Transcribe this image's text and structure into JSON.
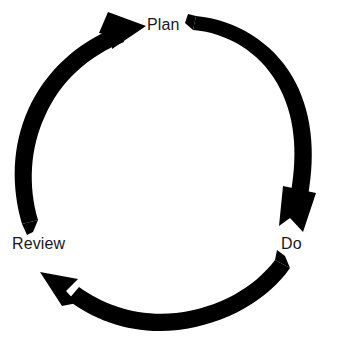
{
  "diagram": {
    "type": "cycle",
    "title": "",
    "shape": "circular-three-stage-cycle",
    "direction": "clockwise",
    "background_color": "#ffffff",
    "arrow_color": "#000000",
    "label_color": "#1a1a1a",
    "stages": [
      {
        "id": "plan",
        "label": "Plan",
        "position": "top"
      },
      {
        "id": "do",
        "label": "Do",
        "position": "right"
      },
      {
        "id": "review",
        "label": "Review",
        "position": "left"
      }
    ],
    "arrows": [
      {
        "id": "plan-to-do",
        "name": "arrow-plan-to-do",
        "from": "Plan",
        "to": "Do",
        "side": "right",
        "tail": "notched",
        "head": "solid-triangle"
      },
      {
        "id": "do-to-review",
        "name": "arrow-do-to-review",
        "from": "Do",
        "to": "Review",
        "side": "bottom",
        "tail": "notched",
        "head": "solid-triangle"
      },
      {
        "id": "review-to-plan",
        "name": "arrow-review-to-plan",
        "from": "Review",
        "to": "Plan",
        "side": "left",
        "tail": "notched",
        "head": "solid-triangle"
      }
    ],
    "geometry": {
      "center_x": 161,
      "center_y": 172,
      "radius": 143,
      "stroke_width": 16
    }
  }
}
